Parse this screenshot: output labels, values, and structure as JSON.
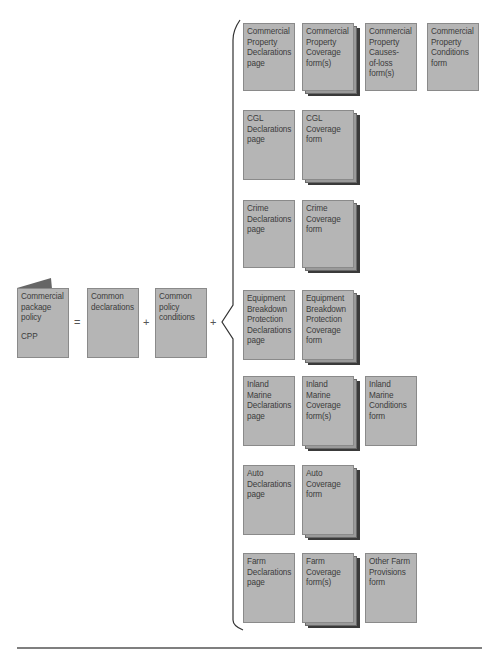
{
  "diagram": {
    "left": {
      "cpp": {
        "lines": [
          "Commercial",
          "package",
          "policy"
        ],
        "abbr": "CPP"
      },
      "equals": "=",
      "common_declarations": {
        "lines": [
          "Common",
          "declarations"
        ]
      },
      "plus1": "+",
      "common_conditions": {
        "lines": [
          "Common",
          "policy",
          "conditions"
        ]
      },
      "plus2": "+"
    },
    "rows": [
      {
        "name": "commercial-property",
        "items": [
          {
            "lines": [
              "Commercial",
              "Property",
              "Declarations",
              "page"
            ],
            "stacked": false
          },
          {
            "lines": [
              "Commercial",
              "Property",
              "Coverage",
              "form(s)"
            ],
            "stacked": true
          },
          {
            "lines": [
              "Commercial",
              "Property",
              "Causes-",
              "of-loss",
              "form(s)"
            ],
            "stacked": false
          },
          {
            "lines": [
              "Commercial",
              "Property",
              "Conditions",
              "form"
            ],
            "stacked": false
          }
        ]
      },
      {
        "name": "cgl",
        "items": [
          {
            "lines": [
              "CGL",
              "Declarations",
              "page"
            ],
            "stacked": false
          },
          {
            "lines": [
              "CGL",
              "Coverage",
              "form"
            ],
            "stacked": true
          }
        ]
      },
      {
        "name": "crime",
        "items": [
          {
            "lines": [
              "Crime",
              "Declarations",
              "page"
            ],
            "stacked": false
          },
          {
            "lines": [
              "Crime",
              "Coverage",
              "form"
            ],
            "stacked": true
          }
        ]
      },
      {
        "name": "equipment-breakdown",
        "items": [
          {
            "lines": [
              "Equipment",
              "Breakdown",
              "Protection",
              "Declarations",
              "page"
            ],
            "stacked": false
          },
          {
            "lines": [
              "Equipment",
              "Breakdown",
              "Protection",
              "Coverage",
              "form"
            ],
            "stacked": true
          }
        ]
      },
      {
        "name": "inland-marine",
        "items": [
          {
            "lines": [
              "Inland",
              "Marine",
              "Declarations",
              "page"
            ],
            "stacked": false
          },
          {
            "lines": [
              "Inland",
              "Marine",
              "Coverage",
              "form(s)"
            ],
            "stacked": true
          },
          {
            "lines": [
              "Inland",
              "Marine",
              "Conditions",
              "form"
            ],
            "stacked": false
          }
        ]
      },
      {
        "name": "auto",
        "items": [
          {
            "lines": [
              "Auto",
              "Declarations",
              "page"
            ],
            "stacked": false
          },
          {
            "lines": [
              "Auto",
              "Coverage",
              "form"
            ],
            "stacked": true
          }
        ]
      },
      {
        "name": "farm",
        "items": [
          {
            "lines": [
              "Farm",
              "Declarations",
              "page"
            ],
            "stacked": false
          },
          {
            "lines": [
              "Farm",
              "Coverage",
              "form(s)"
            ],
            "stacked": true
          },
          {
            "lines": [
              "Other Farm",
              "Provisions",
              "form"
            ],
            "stacked": false
          }
        ]
      }
    ],
    "colors": {
      "doc_fill": "#b5b5b5",
      "doc_border": "#8a8a8a",
      "text": "#3c3c3c",
      "stack_shadow": "#3a3a3a"
    }
  }
}
